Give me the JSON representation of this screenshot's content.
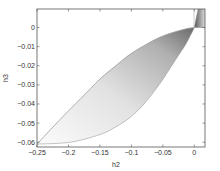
{
  "chart_data": {
    "type": "area",
    "title": "",
    "xlabel": "h2",
    "ylabel": "h3",
    "xlim": [
      -0.25,
      0.017
    ],
    "ylim": [
      -0.0625,
      0.0097
    ],
    "grid": false,
    "legend": null,
    "x_ticks": [
      -0.25,
      -0.2,
      -0.15,
      -0.1,
      -0.05,
      0
    ],
    "x_tick_labels": [
      "-0.25",
      "-0.2",
      "-0.15",
      "-0.1",
      "-0.05",
      "0"
    ],
    "y_ticks": [
      0,
      -0.01,
      -0.02,
      -0.03,
      -0.04,
      -0.05,
      -0.06
    ],
    "y_tick_labels": [
      "0",
      "-0.01",
      "-0.02",
      "-0.03",
      "-0.04",
      "-0.05",
      "-0.06"
    ],
    "series": [
      {
        "name": "upper boundary",
        "x": [
          -0.25,
          -0.213,
          -0.18,
          -0.15,
          -0.125,
          -0.102,
          -0.08,
          -0.054,
          -0.03,
          -0.012,
          0,
          0.017
        ],
        "y": [
          -0.061,
          -0.048,
          -0.037,
          -0.027,
          -0.02,
          -0.014,
          -0.0095,
          -0.005,
          -0.0022,
          -0.0006,
          0,
          0
        ]
      },
      {
        "name": "lower boundary",
        "x": [
          -0.25,
          -0.197,
          -0.15,
          -0.125,
          -0.102,
          -0.08,
          -0.054,
          -0.03,
          -0.015,
          -0.006,
          0,
          0.003,
          0.006
        ],
        "y": [
          -0.061,
          -0.06,
          -0.056,
          -0.052,
          -0.047,
          -0.04,
          -0.029,
          -0.017,
          -0.0095,
          -0.004,
          0,
          0.005,
          0.0097
        ]
      },
      {
        "name": "upper wedge",
        "x": [
          0,
          0.003,
          0.006,
          0.017,
          0.017,
          0
        ],
        "y": [
          0,
          0.005,
          0.0097,
          0.0097,
          0,
          0
        ]
      }
    ],
    "fill": "grayscale gradient, darker toward (0,0)"
  },
  "colors": {
    "axis": "#555555",
    "curve": "#9a9a9a",
    "fill_light": "#f4f4f4",
    "fill_dark": "#6a6a6a"
  }
}
